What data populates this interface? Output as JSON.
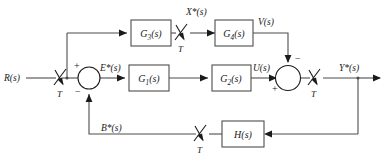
{
  "diagram": {
    "type": "control-block-diagram",
    "colors": {
      "wire": "#4d4d4d",
      "block_border": "#4d4d4d",
      "text": "#1a1a1a",
      "background": "#ffffff"
    },
    "blocks": [
      {
        "id": "G3",
        "label": "G",
        "subscript": "3",
        "suffix": "(s)",
        "full": "G3(s)"
      },
      {
        "id": "G4",
        "label": "G",
        "subscript": "4",
        "suffix": "(s)",
        "full": "G4(s)"
      },
      {
        "id": "G1",
        "label": "G",
        "subscript": "1",
        "suffix": "(s)",
        "full": "G1(s)"
      },
      {
        "id": "G2",
        "label": "G",
        "subscript": "2",
        "suffix": "(s)",
        "full": "G2(s)"
      },
      {
        "id": "H",
        "label": "H",
        "subscript": "",
        "suffix": "(s)",
        "full": "H(s)"
      }
    ],
    "signals": {
      "input": "R(s)",
      "error": "E*(s)",
      "x_star": "X*(s)",
      "v": "V(s)",
      "u": "U(s)",
      "output": "Y*(s)",
      "feedback": "B*(s)"
    },
    "samplers": [
      {
        "id": "sampler-input",
        "label": "T"
      },
      {
        "id": "sampler-x",
        "label": "T"
      },
      {
        "id": "sampler-output",
        "label": "T"
      },
      {
        "id": "sampler-feedback",
        "label": "T"
      }
    ],
    "summing_junctions": [
      {
        "id": "sum-error",
        "signs": [
          "+",
          "−"
        ]
      },
      {
        "id": "sum-output",
        "signs": [
          "−",
          "+"
        ]
      }
    ],
    "signs": {
      "plus": "+",
      "minus": "−"
    }
  }
}
